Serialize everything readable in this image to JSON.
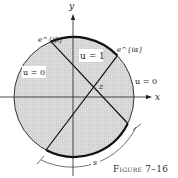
{
  "figure": {
    "caption": "Figure 7–16",
    "axes": {
      "x_label": "x",
      "y_label": "y"
    },
    "points": {
      "e_beta": "e^{iβ}",
      "e_alpha": "e^{iα}",
      "z": "z"
    },
    "region_labels": [
      {
        "id": "left",
        "text": "u = 0"
      },
      {
        "id": "top",
        "text": "u = 1"
      },
      {
        "id": "right",
        "text": "u = 0"
      }
    ],
    "arc_label": "s",
    "colors": {
      "disk_fill": "#d6d6d6",
      "stroke": "#1a1a1a",
      "background": "#ffffff"
    }
  }
}
